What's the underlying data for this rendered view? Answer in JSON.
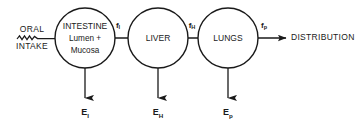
{
  "diagram": {
    "background_color": "#ffffff",
    "stroke_color": "#1a1a1a",
    "width": 363,
    "height": 128
  },
  "input": {
    "line1": "ORAL",
    "line2": "INTAKE",
    "connector_icon": "squiggle-line-icon"
  },
  "nodes": [
    {
      "id": "intestine",
      "line1": "INTESTINE",
      "line2": "Lumen +",
      "line3": "Mucosa",
      "cx": 85,
      "cy": 38,
      "r": 30
    },
    {
      "id": "liver",
      "line1": "LIVER",
      "cx": 158,
      "cy": 38,
      "r": 30
    },
    {
      "id": "lungs",
      "line1": "LUNGS",
      "cx": 228,
      "cy": 38,
      "r": 30
    }
  ],
  "fluxes": [
    {
      "id": "f_I",
      "base": "f",
      "sub": "I",
      "x": 118,
      "y": 26
    },
    {
      "id": "f_H",
      "base": "f",
      "sub": "H",
      "x": 192,
      "y": 26
    },
    {
      "id": "f_p",
      "base": "f",
      "sub": "p",
      "x": 264,
      "y": 26
    }
  ],
  "eliminations": [
    {
      "id": "E_I",
      "base": "E",
      "sub": "I",
      "x": 85,
      "y": 113
    },
    {
      "id": "E_H",
      "base": "E",
      "sub": "H",
      "x": 158,
      "y": 113
    },
    {
      "id": "E_p",
      "base": "E",
      "sub": "p",
      "x": 228,
      "y": 113
    }
  ],
  "output": {
    "label": "DISTRIBUTION",
    "x": 291,
    "y": 38
  }
}
